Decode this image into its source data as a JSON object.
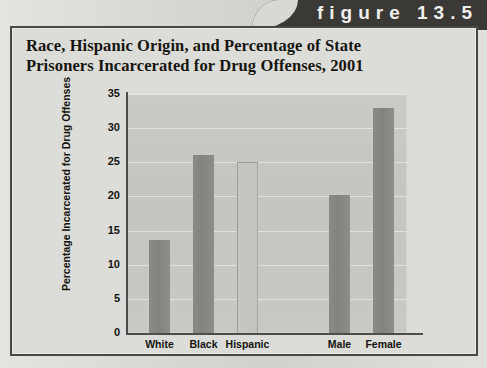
{
  "figure": {
    "tab_label": "figure 13.5",
    "title_line1": "Race, Hispanic Origin, and Percentage of State",
    "title_line2": "Prisoners Incarcerated for Drug Offenses, 2001"
  },
  "colors": {
    "tab_background": "#3b3936",
    "tab_text": "#efefec",
    "frame_border": "#4a4845",
    "page_background": "#d8d8d4",
    "plot_background": "#c8c8c3",
    "bar_fill": "#888883",
    "bar_faint_fill": "#c6c6c1",
    "axis": "#4e4c49",
    "text": "#14140f"
  },
  "chart_data": {
    "type": "bar",
    "title": "Race, Hispanic Origin, and Percentage of State Prisoners Incarcerated for Drug Offenses, 2001",
    "xlabel": "",
    "ylabel": "Percentage Incarcerated for Drug Offenses",
    "categories": [
      "White",
      "Black",
      "Hispanic",
      "Male",
      "Female"
    ],
    "values": [
      13.6,
      26.0,
      25.0,
      20.2,
      33.0
    ],
    "bar_styles": [
      "solid",
      "solid",
      "faint",
      "solid",
      "solid"
    ],
    "group_gap_after_index": 2,
    "ylim": [
      0,
      35
    ],
    "yticks": [
      0,
      5,
      10,
      15,
      20,
      25,
      30,
      35
    ],
    "ytick_labels": [
      "0",
      "5",
      "10",
      "15",
      "20",
      "25",
      "30",
      "35"
    ],
    "grid": true,
    "grid_axis": "y",
    "legend": false
  }
}
